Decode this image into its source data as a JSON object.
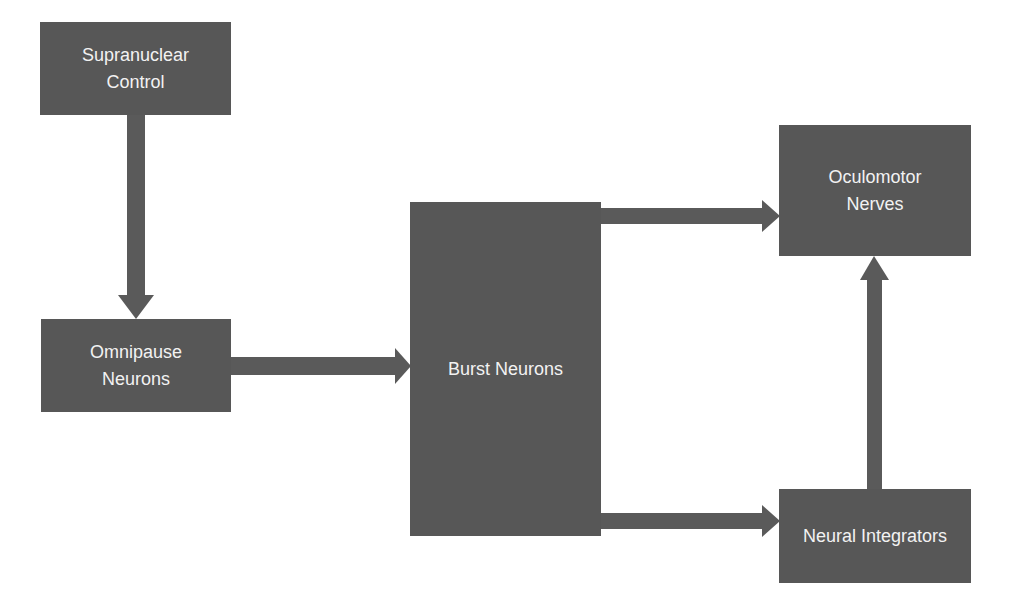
{
  "diagram": {
    "type": "flowchart",
    "colors": {
      "node_fill": "#575757",
      "node_text": "#f2f2f2",
      "arrow": "#5a5a5a",
      "background": "#ffffff"
    },
    "nodes": [
      {
        "id": "supranuclear",
        "lines": [
          "Supranuclear",
          "Control"
        ]
      },
      {
        "id": "omnipause",
        "lines": [
          "Omnipause",
          "Neurons"
        ]
      },
      {
        "id": "burst",
        "lines": [
          "Burst Neurons"
        ]
      },
      {
        "id": "oculomotor",
        "lines": [
          "Oculomotor",
          "Nerves"
        ]
      },
      {
        "id": "integrators",
        "lines": [
          "Neural Integrators"
        ]
      }
    ],
    "edges": [
      {
        "from": "Supranuclear Control",
        "to": "Omnipause Neurons"
      },
      {
        "from": "Omnipause Neurons",
        "to": "Burst Neurons"
      },
      {
        "from": "Burst Neurons",
        "to": "Oculomotor Nerves"
      },
      {
        "from": "Burst Neurons",
        "to": "Neural Integrators"
      },
      {
        "from": "Neural Integrators",
        "to": "Oculomotor Nerves"
      }
    ]
  }
}
